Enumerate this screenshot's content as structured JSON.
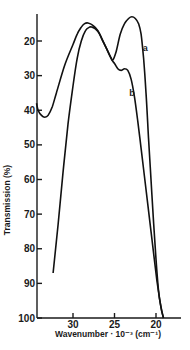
{
  "chart_data": {
    "type": "line",
    "title": "",
    "xlabel": "Wavenumber · 10⁻³ (cm⁻¹)",
    "ylabel": "Transmission (%)",
    "xlim": [
      34.4,
      18.0
    ],
    "ylim": [
      12,
      100
    ],
    "y_inverted": true,
    "x_reversed": true,
    "xticks": [
      30,
      25,
      20
    ],
    "yticks": [
      20,
      30,
      40,
      50,
      60,
      70,
      80,
      90,
      100
    ],
    "grid": false,
    "series": [
      {
        "name": "a",
        "x": [
          34.4,
          34.2,
          33.8,
          33.4,
          33.0,
          32.5,
          32.0,
          31.0,
          30.0,
          29.5,
          29.0,
          28.6,
          28.2,
          27.6,
          27.0,
          26.5,
          26.0,
          25.5,
          25.2,
          24.8,
          24.3,
          23.8,
          23.3,
          22.9,
          22.5,
          22.1,
          21.8,
          21.5,
          21.2,
          20.9,
          20.6,
          20.3,
          20.0,
          19.7,
          19.4,
          19.1
        ],
        "y": [
          38,
          40,
          41.5,
          42,
          41.5,
          39,
          35,
          27,
          21,
          18,
          16,
          15,
          14.8,
          15.5,
          17,
          19.5,
          22,
          24.5,
          25.5,
          23,
          18,
          15,
          13.5,
          13,
          13.5,
          15,
          18,
          25,
          35,
          48,
          60,
          72,
          83,
          92,
          97,
          100
        ]
      },
      {
        "name": "b",
        "x": [
          32.4,
          31.8,
          31.2,
          30.6,
          30.0,
          29.5,
          29.0,
          28.5,
          28.0,
          27.7,
          27.3,
          26.8,
          26.3,
          25.8,
          25.3,
          25.0,
          24.6,
          24.2,
          23.8,
          23.4,
          23.0,
          22.6,
          22.2,
          21.8,
          21.4,
          21.0,
          20.6,
          20.2,
          19.9,
          19.6,
          19.3,
          19.1
        ],
        "y": [
          87,
          73,
          58,
          44,
          33,
          25,
          20,
          17,
          16,
          16,
          16.5,
          18,
          20.5,
          23,
          25.5,
          26.5,
          28,
          28.5,
          28,
          28.5,
          31,
          36,
          43,
          51,
          59,
          67,
          75,
          83,
          89,
          94,
          98,
          100
        ]
      }
    ],
    "annotations": [
      {
        "text": "a",
        "x": 21.3,
        "y": 23
      },
      {
        "text": "b",
        "x": 22.9,
        "y": 36
      }
    ]
  }
}
